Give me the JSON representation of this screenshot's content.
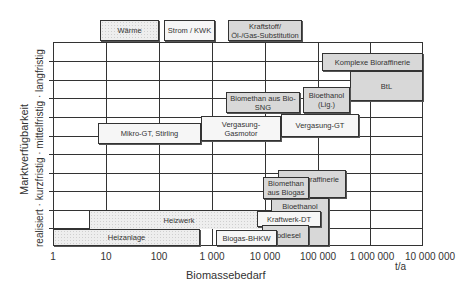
{
  "legend": {
    "heat": "Wärme",
    "power": "Strom / KWK",
    "fuel_line1": "Kraftstoff/",
    "fuel_line2": "Öl-/Gas-Substitution"
  },
  "axes": {
    "xlabel": "Biomassebedarf",
    "xunit": "t/a",
    "xticks": [
      "1",
      "10",
      "100",
      "1 000",
      "10 000",
      "100 000",
      "1 000 000",
      "10 000 000"
    ],
    "ylabel": "Marktverfügbarkeit",
    "ysub": "realisiert · kurzfristig · mittelfristig · langfristig"
  },
  "boxes": {
    "komplexe": "Komplexe Bioraffinerie",
    "btl": "BtL",
    "biomethan_sng_1": "Biomethan aus Bio-",
    "biomethan_sng_2": "SNG",
    "bioethanol_lig_1": "Bioethanol",
    "bioethanol_lig_2": "(Lig.)",
    "mikro": "Mikro-GT, Stirling",
    "vg_gasmotor_1": "Vergasung-",
    "vg_gasmotor_2": "Gasmotor",
    "vg_gt": "Vergasung-GT",
    "bioraffinerie": "Bioraffinerie",
    "biomethan_biogas_1": "Biomethan",
    "biomethan_biogas_2": "aus Biogas",
    "bioethanol_getr": "Bioethanol (Getr.)",
    "heizwerk": "Heizwerk",
    "kraftwerk_dt": "Kraftwerk-DT",
    "heizanlage": "Heizanlage",
    "biogas_bhkw": "Biogas-BHKW",
    "biodiesel": "Biodiesel"
  }
}
